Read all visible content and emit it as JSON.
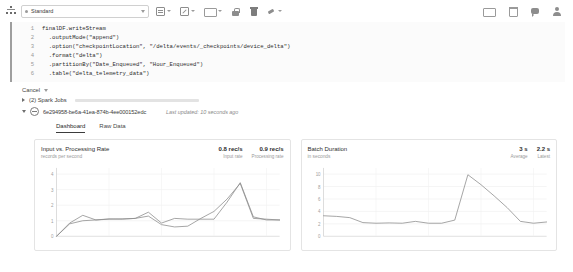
{
  "toolbar": {
    "cluster_icon": "cluster-icon",
    "cluster_status": "attached",
    "cluster_name": "Standard",
    "buttons": [
      {
        "name": "file-menu",
        "icon": "file-icon"
      },
      {
        "name": "edit-menu",
        "icon": "edit-pencil-icon"
      },
      {
        "name": "view-menu",
        "icon": "view-icon"
      },
      {
        "name": "permissions",
        "icon": "lock-icon"
      },
      {
        "name": "delete-cell",
        "icon": "trash-icon"
      },
      {
        "name": "attach-detach",
        "icon": "plug-icon"
      }
    ],
    "right_buttons": [
      {
        "name": "present-mode",
        "icon": "monitor-icon"
      },
      {
        "name": "schedule",
        "icon": "calendar-icon"
      },
      {
        "name": "comments",
        "icon": "comment-icon"
      },
      {
        "name": "user-account",
        "icon": "user-icon"
      }
    ]
  },
  "code": {
    "lines": [
      {
        "no": "1",
        "text": "finalDF.writeStream"
      },
      {
        "no": "2",
        "text": "  .outputMode(\"append\")"
      },
      {
        "no": "3",
        "text": "  .option(\"checkpointLocation\", \"/delta/events/_checkpoints/device_delta\")"
      },
      {
        "no": "4",
        "text": "  .format(\"delta\")"
      },
      {
        "no": "5",
        "text": "  .partitionBy(\"Date_Enqueued\", \"Hour_Enqueued\")"
      },
      {
        "no": "6",
        "text": "  .table(\"delta_telemetry_data\")"
      }
    ]
  },
  "execution": {
    "cancel_label": "Cancel",
    "spark_jobs_label": "(2) Spark Jobs",
    "progress_percent": 72,
    "query_id": "6e294958-be6a-41ea-874b-4ee000152edc",
    "last_updated": "Last updated: 10 seconds ago"
  },
  "tabs": [
    {
      "label": "Dashboard",
      "active": true
    },
    {
      "label": "Raw Data",
      "active": false
    }
  ],
  "chart_data": [
    {
      "type": "line",
      "title": "Input vs. Processing Rate",
      "subtitle": "records per second",
      "ylabel": "records per second",
      "xlabel": "",
      "ylim": [
        0,
        4.4
      ],
      "yticks": [
        "0",
        "1",
        "2",
        "3",
        "4"
      ],
      "grid": true,
      "legend_position": "top-right",
      "metrics": [
        {
          "value": "0.8 rec/s",
          "label": "Input rate"
        },
        {
          "value": "0.9 rec/s",
          "label": "Processing rate"
        }
      ],
      "x": [
        0,
        1,
        2,
        3,
        4,
        5,
        6,
        7,
        8,
        9,
        10,
        11,
        12,
        13,
        14,
        15,
        16,
        17
      ],
      "series": [
        {
          "name": "Input rate",
          "values": [
            0.0,
            0.85,
            1.35,
            1.05,
            1.1,
            1.12,
            1.15,
            1.55,
            0.85,
            1.15,
            1.1,
            1.1,
            1.1,
            2.2,
            3.45,
            1.25,
            1.05,
            1.05
          ]
        },
        {
          "name": "Processing rate",
          "values": [
            0.0,
            0.8,
            1.0,
            1.05,
            1.12,
            1.1,
            1.15,
            1.3,
            0.75,
            0.6,
            0.65,
            1.15,
            1.6,
            2.4,
            3.4,
            1.15,
            1.1,
            1.05
          ]
        }
      ]
    },
    {
      "type": "line",
      "title": "Batch Duration",
      "subtitle": "in seconds",
      "ylabel": "in seconds",
      "xlabel": "",
      "ylim": [
        0,
        11
      ],
      "yticks": [
        "0",
        "2",
        "4",
        "6",
        "8",
        "10"
      ],
      "grid": true,
      "legend_position": "top-right",
      "metrics": [
        {
          "value": "3 s",
          "label": "Average"
        },
        {
          "value": "2.2 s",
          "label": "Latest"
        }
      ],
      "x": [
        0,
        1,
        2,
        3,
        4,
        5,
        6,
        7,
        8,
        9,
        10,
        11,
        12,
        13,
        14,
        15,
        16,
        17
      ],
      "series": [
        {
          "name": "Batch duration",
          "values": [
            3.3,
            3.2,
            3.0,
            2.2,
            2.1,
            2.15,
            2.1,
            2.4,
            2.1,
            2.1,
            2.6,
            9.9,
            8.3,
            6.5,
            4.6,
            2.4,
            2.1,
            2.3
          ]
        }
      ]
    }
  ]
}
